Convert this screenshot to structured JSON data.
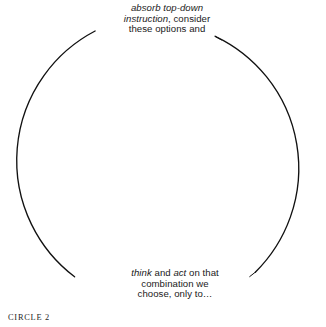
{
  "figure": {
    "caption": "CIRCLE 2",
    "background_color": "#ffffff",
    "stroke_color": "#111111",
    "text_color": "#1a1a1a"
  },
  "diagram": {
    "type": "cycle-circle",
    "shape": "open circle with two gaps (top and bottom) where label text sits",
    "center_x": 162,
    "center_y": 161,
    "radius": 146,
    "stroke_width": 1.3,
    "gap_top_degrees": 46,
    "gap_bottom_degrees": 42
  },
  "labels": {
    "top": {
      "line1_italic": "absorb top-down",
      "line2_italic": "instruction",
      "line2_rest": ", consider",
      "line3": "these options and",
      "plain_text": "absorb top-down instruction, consider these options and"
    },
    "bottom": {
      "line1_italic_a": "think",
      "line1_mid": " and ",
      "line1_italic_b": "act",
      "line1_rest": " on that",
      "line2": "combination we",
      "line3": "choose, only to…",
      "plain_text": "think and act on that combination we choose, only to…"
    }
  }
}
